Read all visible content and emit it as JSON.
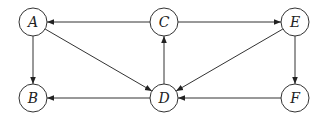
{
  "diagram": {
    "type": "directed-graph",
    "nodes": [
      {
        "id": "A",
        "label": "A",
        "x": 33,
        "y": 22
      },
      {
        "id": "B",
        "label": "B",
        "x": 33,
        "y": 98
      },
      {
        "id": "C",
        "label": "C",
        "x": 164,
        "y": 22
      },
      {
        "id": "D",
        "label": "D",
        "x": 164,
        "y": 98
      },
      {
        "id": "E",
        "label": "E",
        "x": 295,
        "y": 22
      },
      {
        "id": "F",
        "label": "F",
        "x": 295,
        "y": 98
      }
    ],
    "edges": [
      {
        "from": "C",
        "to": "A"
      },
      {
        "from": "C",
        "to": "E"
      },
      {
        "from": "A",
        "to": "B"
      },
      {
        "from": "A",
        "to": "D"
      },
      {
        "from": "D",
        "to": "C"
      },
      {
        "from": "E",
        "to": "D"
      },
      {
        "from": "E",
        "to": "F"
      },
      {
        "from": "F",
        "to": "D"
      },
      {
        "from": "D",
        "to": "B"
      }
    ],
    "node_radius": 14,
    "stroke_color": "#333333"
  }
}
